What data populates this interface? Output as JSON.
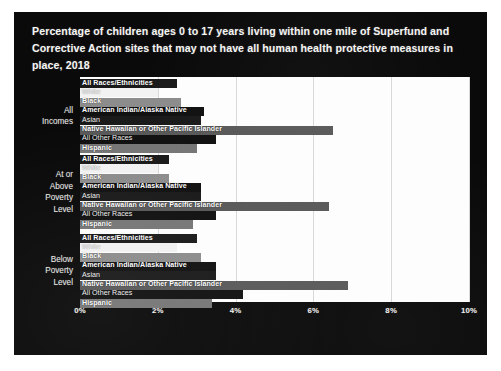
{
  "slide": {
    "title": "Percentage of children ages 0 to 17 years living within one mile of Superfund and Corrective Action sites that may not have all human health protective measures in place, 2018",
    "background_color": "#0a0a0a",
    "plot_background_color": "#fdfdfd",
    "title_color": "#f4f4f2"
  },
  "chart_data": {
    "type": "bar",
    "orientation": "horizontal",
    "title": "Percentage of children ages 0 to 17 years living within one mile of Superfund and Corrective Action sites that may not have all human health protective measures in place, 2018",
    "xlabel": "",
    "ylabel": "",
    "xlim": [
      0,
      10
    ],
    "xtick_labels": [
      "0%",
      "2%",
      "4%",
      "6%",
      "8%",
      "10%"
    ],
    "xtick_values": [
      0,
      2,
      4,
      6,
      8,
      10
    ],
    "grid": "vertical",
    "legend": "inline-bar-labels",
    "categories": [
      "All Incomes",
      "At or Above Poverty Level",
      "Below Poverty Level"
    ],
    "series_names": [
      "All Races/Ethnicities",
      "White",
      "Black",
      "American Indian/Alaska Native",
      "Asian",
      "Native Hawaiian or Other Pacific Islander",
      "All Other Races",
      "Hispanic"
    ],
    "series_colors": [
      "#1a1a1a",
      "#f2f2f2",
      "#8c8c8c",
      "#111111",
      "#1a1a1a",
      "#595959",
      "#111111",
      "#767676"
    ],
    "groups": [
      {
        "label": "All Incomes",
        "label_lines": "All\nIncomes",
        "bars": [
          {
            "name": "All Races/Ethnicities",
            "value": 2.5,
            "color": "#1a1a1a",
            "label_style": "dark"
          },
          {
            "name": "White",
            "value": 2.0,
            "color": "#f2f2f2",
            "label_style": "light"
          },
          {
            "name": "Black",
            "value": 2.6,
            "color": "#8c8c8c",
            "label_style": "dark"
          },
          {
            "name": "American Indian/Alaska Native",
            "value": 3.2,
            "color": "#111111",
            "label_style": "dark"
          },
          {
            "name": "Asian",
            "value": 3.1,
            "color": "#1a1a1a",
            "label_style": "light"
          },
          {
            "name": "Native Hawaiian or Other Pacific Islander",
            "value": 6.5,
            "color": "#595959",
            "label_style": "dark"
          },
          {
            "name": "All Other Races",
            "value": 3.5,
            "color": "#111111",
            "label_style": "light"
          },
          {
            "name": "Hispanic",
            "value": 3.0,
            "color": "#767676",
            "label_style": "dark"
          }
        ]
      },
      {
        "label": "At or Above Poverty Level",
        "label_lines": "At or\nAbove\nPoverty\nLevel",
        "bars": [
          {
            "name": "All Races/Ethnicities",
            "value": 2.3,
            "color": "#1a1a1a",
            "label_style": "dark"
          },
          {
            "name": "White",
            "value": 2.0,
            "color": "#f2f2f2",
            "label_style": "light"
          },
          {
            "name": "Black",
            "value": 2.3,
            "color": "#8c8c8c",
            "label_style": "dark"
          },
          {
            "name": "American Indian/Alaska Native",
            "value": 3.1,
            "color": "#111111",
            "label_style": "dark"
          },
          {
            "name": "Asian",
            "value": 3.1,
            "color": "#1a1a1a",
            "label_style": "light"
          },
          {
            "name": "Native Hawaiian or Other Pacific Islander",
            "value": 6.4,
            "color": "#595959",
            "label_style": "dark"
          },
          {
            "name": "All Other Races",
            "value": 3.5,
            "color": "#111111",
            "label_style": "light"
          },
          {
            "name": "Hispanic",
            "value": 2.9,
            "color": "#767676",
            "label_style": "dark"
          }
        ]
      },
      {
        "label": "Below Poverty Level",
        "label_lines": "Below\nPoverty\nLevel",
        "bars": [
          {
            "name": "All Races/Ethnicities",
            "value": 3.0,
            "color": "#1a1a1a",
            "label_style": "dark"
          },
          {
            "name": "White",
            "value": 2.5,
            "color": "#f2f2f2",
            "label_style": "light"
          },
          {
            "name": "Black",
            "value": 3.1,
            "color": "#8c8c8c",
            "label_style": "dark"
          },
          {
            "name": "American Indian/Alaska Native",
            "value": 3.5,
            "color": "#111111",
            "label_style": "dark"
          },
          {
            "name": "Asian",
            "value": 3.5,
            "color": "#1a1a1a",
            "label_style": "light"
          },
          {
            "name": "Native Hawaiian or Other Pacific Islander",
            "value": 6.9,
            "color": "#595959",
            "label_style": "dark"
          },
          {
            "name": "All Other Races",
            "value": 4.2,
            "color": "#111111",
            "label_style": "light"
          },
          {
            "name": "Hispanic",
            "value": 3.4,
            "color": "#767676",
            "label_style": "dark"
          }
        ]
      }
    ]
  }
}
